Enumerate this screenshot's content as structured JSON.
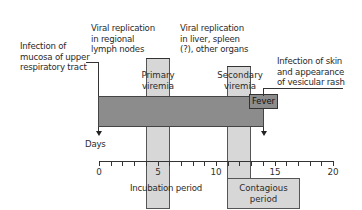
{
  "diagram": {
    "labels": {
      "infection_mucosa": "Infection of\nmucosa of upper\nrespiratory tract",
      "viral_lymph": "Viral replication\nin regional\nlymph nodes",
      "viral_liver": "Viral replication\nin liver, spleen\n(?), other organs",
      "infection_skin": "Infection of skin\nand appearance\nof vesicular rash",
      "primary_viremia": "Primary\nviremia",
      "secondary_viremia": "Secondary\nviremia",
      "fever": "Fever",
      "days": "Days",
      "incubation": "Incubation period",
      "contagious": "Contagious\nperiod"
    },
    "axis": {
      "label": "Days",
      "min": 0,
      "max": 20,
      "ticks": [
        "0",
        "5",
        "10",
        "15",
        "20"
      ],
      "minor_step": 1
    },
    "phases": [
      {
        "name": "Infection of upper respiratory tract",
        "start_day": 0
      },
      {
        "name": "Primary viremia",
        "start_day": 4,
        "end_day": 6
      },
      {
        "name": "Secondary viremia",
        "start_day": 11,
        "end_day": 13
      },
      {
        "name": "Fever",
        "start_day": 13,
        "end_day": 15
      },
      {
        "name": "Incubation period",
        "start_day": 0,
        "end_day": 14
      },
      {
        "name": "Contagious period",
        "start_day": 11,
        "end_day": 17
      },
      {
        "name": "Infection of skin and vesicular rash",
        "start_day": 14
      }
    ],
    "colors": {
      "main_bar": "#8c8c8c",
      "light_band": "#d7d7d7",
      "outline": "#444444"
    }
  }
}
